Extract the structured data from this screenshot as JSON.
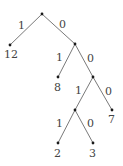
{
  "diagram": {
    "type": "binary-code-tree",
    "nodes": [
      {
        "id": "root",
        "x": 42,
        "y": 14
      },
      {
        "id": "leaf-12",
        "x": 10,
        "y": 45,
        "label": "12"
      },
      {
        "id": "n1",
        "x": 75,
        "y": 44
      },
      {
        "id": "leaf-8",
        "x": 58,
        "y": 77,
        "label": "8"
      },
      {
        "id": "n2",
        "x": 93,
        "y": 77
      },
      {
        "id": "n3",
        "x": 75,
        "y": 110
      },
      {
        "id": "leaf-7",
        "x": 112,
        "y": 110,
        "label": "7"
      },
      {
        "id": "leaf-2",
        "x": 58,
        "y": 143,
        "label": "2"
      },
      {
        "id": "leaf-3",
        "x": 93,
        "y": 143,
        "label": "3"
      }
    ],
    "edges": [
      {
        "from": "root",
        "to": "leaf-12",
        "label": "1"
      },
      {
        "from": "root",
        "to": "n1",
        "label": "0"
      },
      {
        "from": "n1",
        "to": "leaf-8",
        "label": "1"
      },
      {
        "from": "n1",
        "to": "n2",
        "label": "0"
      },
      {
        "from": "n2",
        "to": "n3",
        "label": "1"
      },
      {
        "from": "n2",
        "to": "leaf-7",
        "label": "0"
      },
      {
        "from": "n3",
        "to": "leaf-2",
        "label": "1"
      },
      {
        "from": "n3",
        "to": "leaf-3",
        "label": "0"
      }
    ]
  }
}
